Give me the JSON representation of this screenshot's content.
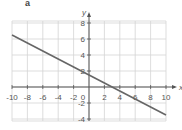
{
  "panel_label": "a",
  "chart_data": {
    "type": "line",
    "title": "",
    "xlabel": "x",
    "ylabel": "y",
    "xlim": [
      -10,
      10
    ],
    "ylim": [
      -4,
      8
    ],
    "grid": true,
    "x_ticks": [
      -10,
      -8,
      -6,
      -4,
      -2,
      0,
      2,
      4,
      6,
      8,
      10
    ],
    "x_tick_labels": [
      "-10",
      "-8",
      "-6",
      "-4",
      "-2",
      "0",
      "2",
      "4",
      "6",
      "8",
      "10"
    ],
    "y_ticks": [
      -4,
      -2,
      2,
      4,
      6,
      8
    ],
    "y_tick_labels": [
      "-4",
      "-2",
      "2",
      "4",
      "6",
      "8"
    ],
    "series": [
      {
        "name": "line",
        "equation": "y = -0.5x + 1.5",
        "x": [
          -10,
          10
        ],
        "y": [
          6.5,
          -3.5
        ],
        "color": "#666666"
      }
    ],
    "legend": null
  },
  "colors": {
    "grid": "#d4d4d4",
    "axis": "#555555",
    "line": "#666666"
  }
}
